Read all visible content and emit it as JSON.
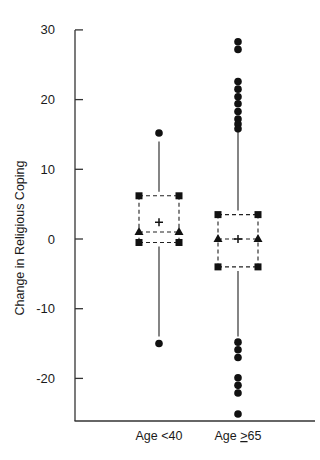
{
  "chart_data": {
    "type": "box",
    "title": "",
    "xlabel": "",
    "ylabel": "Change in Religious Coping",
    "ylim": [
      -26,
      31
    ],
    "yticks": [
      30,
      20,
      10,
      0,
      -10,
      -20
    ],
    "ytick_labels": [
      "30",
      "20",
      "10",
      "0",
      "-10",
      "-20"
    ],
    "grid": false,
    "legend": null,
    "categories": [
      "Age <40",
      "Age ≥65"
    ],
    "category_label_parts": [
      {
        "prefix": "Age <40",
        "underlined": "",
        "suffix": ""
      },
      {
        "prefix": "Age ",
        "underlined": ">",
        "suffix": "65"
      }
    ],
    "series": [
      {
        "name": "Age <40",
        "q3": 6.2,
        "median": 1.0,
        "mean": 2.4,
        "q1": -0.5,
        "whisker_high": 14.0,
        "whisker_low": -14.0,
        "outliers": [
          15.2,
          -15.0
        ]
      },
      {
        "name": "Age ≥65",
        "q3": 3.5,
        "median": 0.0,
        "mean": 0.0,
        "q1": -4.0,
        "whisker_high": 15.3,
        "whisker_low": -14.0,
        "outliers": [
          28.3,
          27.2,
          22.6,
          21.5,
          20.4,
          19.4,
          18.3,
          17.2,
          16.5,
          15.8,
          -14.8,
          -15.9,
          -17.0,
          -19.9,
          -21.0,
          -22.1,
          -25.1
        ]
      }
    ],
    "markers": {
      "quartile": "filled-square",
      "median": "filled-triangle",
      "mean": "plus",
      "outlier": "filled-circle",
      "box_line": "dashed"
    }
  },
  "axis": {
    "ylabel": "Change in Religious Coping",
    "cat1_label": "Age <40",
    "cat2_prefix": "Age ",
    "cat2_underlined": ">",
    "cat2_suffix": "65"
  }
}
